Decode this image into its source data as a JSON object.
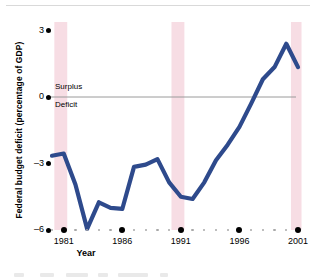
{
  "chart_data": {
    "type": "line",
    "title": "",
    "xlabel": "Year",
    "ylabel": "Federal budget deficit (percentage of GDP)",
    "xlim": [
      1980,
      2001
    ],
    "ylim": [
      -6,
      3
    ],
    "ytick_labels": [
      "3",
      "0",
      "-3",
      "-6"
    ],
    "ytick_values": [
      3,
      0,
      -3,
      -6
    ],
    "xtick_labels": [
      "1981",
      "1986",
      "1991",
      "1996",
      "2001"
    ],
    "xtick_values": [
      1981,
      1986,
      1991,
      1996,
      2001
    ],
    "grid": false,
    "legend": "none",
    "zero_line": true,
    "annotations": [
      {
        "text": "Surplus",
        "position": "above-zero-line"
      },
      {
        "text": "Deficit",
        "position": "below-zero-line"
      }
    ],
    "shaded_bands": [
      {
        "label": "recession",
        "x_start": 1980.2,
        "x_end": 1981.3,
        "color": "#f7dde4"
      },
      {
        "label": "recession",
        "x_start": 1990.2,
        "x_end": 1991.3,
        "color": "#f7dde4"
      },
      {
        "label": "recession",
        "x_start": 2000.4,
        "x_end": 2001.3,
        "color": "#f7dde4"
      }
    ],
    "series": [
      {
        "name": "Federal budget deficit",
        "color": "#2e4a8c",
        "x": [
          1980,
          1981,
          1982,
          1983,
          1984,
          1985,
          1986,
          1987,
          1988,
          1989,
          1990,
          1991,
          1992,
          1993,
          1994,
          1995,
          1996,
          1997,
          1998,
          1999,
          2000,
          2001
        ],
        "values": [
          -2.65,
          -2.55,
          -3.95,
          -5.95,
          -4.75,
          -5.0,
          -5.05,
          -3.15,
          -3.05,
          -2.8,
          -3.85,
          -4.5,
          -4.6,
          -3.85,
          -2.85,
          -2.15,
          -1.35,
          -0.3,
          0.8,
          1.35,
          2.4,
          1.35
        ]
      }
    ]
  },
  "axis": {
    "ytick_dot": "axis-dot",
    "xtick_major_dot": "axis-dot-major",
    "xtick_minor_dot": "axis-dot-minor"
  }
}
